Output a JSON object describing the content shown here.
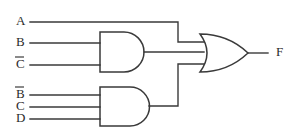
{
  "diagram": {
    "type": "logic-circuit",
    "line_color": "#3a3a3a",
    "text_color": "#2b2b2b",
    "background_color": "#ffffff"
  },
  "inputs": [
    {
      "id": "A",
      "label": "A",
      "overline": false,
      "y": 22,
      "label_x": 16,
      "wire_x_start": 30
    },
    {
      "id": "B",
      "label": "B",
      "overline": false,
      "y": 43,
      "label_x": 16,
      "wire_x_start": 30
    },
    {
      "id": "Cbar",
      "label": "C",
      "overline": true,
      "y": 65,
      "label_x": 16,
      "wire_x_start": 30
    },
    {
      "id": "Bbar",
      "label": "B",
      "overline": true,
      "y": 95,
      "label_x": 16,
      "wire_x_start": 30
    },
    {
      "id": "C",
      "label": "C",
      "overline": false,
      "y": 107,
      "label_x": 16,
      "wire_x_start": 30
    },
    {
      "id": "D",
      "label": "D",
      "overline": false,
      "y": 119,
      "label_x": 16,
      "wire_x_start": 30
    }
  ],
  "gates": [
    {
      "id": "and-upper",
      "kind": "AND",
      "inputs": [
        "B",
        "Cbar"
      ],
      "x": 100,
      "y": 32,
      "width": 48,
      "height": 40,
      "output_y": 52
    },
    {
      "id": "and-lower",
      "kind": "AND",
      "inputs": [
        "Bbar",
        "C",
        "D"
      ],
      "x": 100,
      "y": 87,
      "width": 50,
      "height": 39,
      "output_y": 106
    },
    {
      "id": "or-final",
      "kind": "OR",
      "inputs": [
        "A",
        "and-upper",
        "and-lower"
      ],
      "x": 200,
      "y": 34,
      "width": 48,
      "height": 38,
      "output_y": 53
    }
  ],
  "output": {
    "id": "F",
    "label": "F",
    "label_x": 276,
    "y": 53,
    "wire_x_start": 248,
    "wire_x_end": 268
  },
  "routing": {
    "a_corner_x": 178,
    "a_drop_to_y": 42,
    "lower_rise_x": 178,
    "lower_rise_to_y": 64,
    "or_input_top_y": 42,
    "or_input_mid_y": 53,
    "or_input_bot_y": 64,
    "or_input_x": 204
  }
}
